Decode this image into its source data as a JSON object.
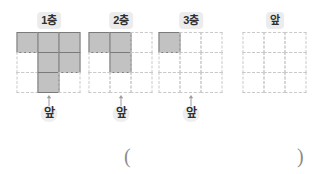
{
  "page": {
    "grid_size": 3,
    "colors": {
      "filled_fill": "#c2c2c2",
      "filled_stroke": "#7a7a7a",
      "grid_dash": "#c9c9c9",
      "label_bg": "#ececec",
      "text": "#2f2f2f",
      "paren": "#8c8c8c"
    }
  },
  "figures": [
    {
      "id": "figure-1",
      "tier_label": "1층",
      "front_label": "앞",
      "arrow_icon": "arrow-up-icon",
      "filled_cells": [
        [
          true,
          true,
          true
        ],
        [
          false,
          true,
          true
        ],
        [
          false,
          true,
          false
        ]
      ],
      "filled_count": 6
    },
    {
      "id": "figure-2",
      "tier_label": "2층",
      "front_label": "앞",
      "arrow_icon": "arrow-up-icon",
      "filled_cells": [
        [
          true,
          true,
          false
        ],
        [
          false,
          true,
          false
        ],
        [
          false,
          false,
          false
        ]
      ],
      "filled_count": 3
    },
    {
      "id": "figure-3",
      "tier_label": "3층",
      "front_label": "앞",
      "arrow_icon": "arrow-up-icon",
      "filled_cells": [
        [
          true,
          false,
          false
        ],
        [
          false,
          false,
          false
        ],
        [
          false,
          false,
          false
        ]
      ],
      "filled_count": 1
    },
    {
      "id": "figure-4",
      "tier_label": "앞",
      "front_label": "",
      "arrow_icon": "",
      "filled_cells": [
        [
          false,
          false,
          false
        ],
        [
          false,
          false,
          false
        ],
        [
          false,
          false,
          false
        ]
      ],
      "filled_count": 0
    }
  ],
  "answer": {
    "open_paren": "(",
    "close_paren": ")",
    "value": ""
  }
}
